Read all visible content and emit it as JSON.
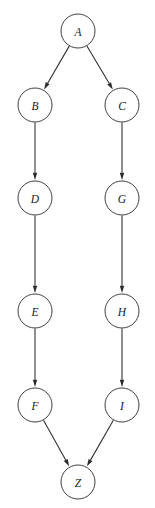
{
  "diagram": {
    "type": "directed-graph",
    "title": "",
    "background_color": "#ffffff",
    "node_stroke_color": "#2b2b2b",
    "node_fill_color": "#ffffff",
    "edge_color": "#2b2b2b",
    "label_color": "#1a1a1a",
    "node_radius": 17,
    "nodes": [
      {
        "id": "A",
        "label": "A",
        "cx": 78,
        "cy": 31
      },
      {
        "id": "B",
        "label": "B",
        "cx": 35,
        "cy": 105
      },
      {
        "id": "C",
        "label": "C",
        "cx": 122,
        "cy": 105
      },
      {
        "id": "D",
        "label": "D",
        "cx": 35,
        "cy": 198
      },
      {
        "id": "G",
        "label": "G",
        "cx": 122,
        "cy": 198
      },
      {
        "id": "E",
        "label": "E",
        "cx": 35,
        "cy": 311
      },
      {
        "id": "H",
        "label": "H",
        "cx": 122,
        "cy": 311
      },
      {
        "id": "F",
        "label": "F",
        "cx": 35,
        "cy": 405
      },
      {
        "id": "I",
        "label": "I",
        "cx": 122,
        "cy": 405
      },
      {
        "id": "Z",
        "label": "Z",
        "cx": 78,
        "cy": 482
      }
    ],
    "edges": [
      {
        "from": "A",
        "to": "B",
        "label": ""
      },
      {
        "from": "A",
        "to": "C",
        "label": ""
      },
      {
        "from": "B",
        "to": "D",
        "label": ""
      },
      {
        "from": "C",
        "to": "G",
        "label": ""
      },
      {
        "from": "D",
        "to": "E",
        "label": ""
      },
      {
        "from": "G",
        "to": "H",
        "label": ""
      },
      {
        "from": "E",
        "to": "F",
        "label": ""
      },
      {
        "from": "H",
        "to": "I",
        "label": ""
      },
      {
        "from": "F",
        "to": "Z",
        "label": ""
      },
      {
        "from": "I",
        "to": "Z",
        "label": ""
      }
    ]
  }
}
